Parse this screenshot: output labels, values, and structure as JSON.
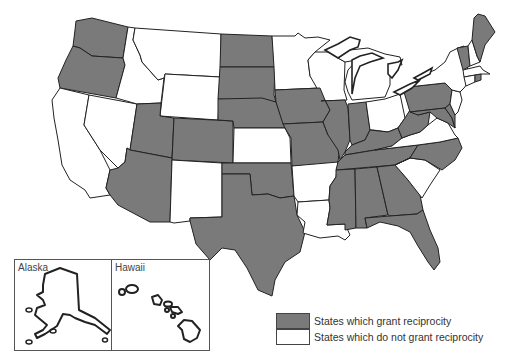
{
  "map": {
    "title": "",
    "colors": {
      "grant": "#7a7a7a",
      "no_grant": "#ffffff",
      "border": "#222222"
    },
    "states_grant": [
      "Washington",
      "Oregon",
      "Utah",
      "Arizona",
      "Colorado",
      "North Dakota",
      "South Dakota",
      "Nebraska",
      "Oklahoma",
      "Texas",
      "Iowa",
      "Missouri",
      "Illinois",
      "Indiana",
      "Kentucky",
      "Tennessee",
      "Mississippi",
      "Alabama",
      "Georgia",
      "Florida",
      "North Carolina",
      "West Virginia",
      "Pennsylvania",
      "Maryland",
      "Delaware",
      "Vermont",
      "Maine",
      "Rhode Island"
    ],
    "states_no_grant": [
      "California",
      "Nevada",
      "Idaho",
      "Montana",
      "Wyoming",
      "New Mexico",
      "Kansas",
      "Minnesota",
      "Wisconsin",
      "Michigan",
      "Arkansas",
      "Louisiana",
      "Ohio",
      "Virginia",
      "South Carolina",
      "New York",
      "New Jersey",
      "New Hampshire",
      "Massachusetts",
      "Connecticut",
      "Alaska",
      "Hawaii"
    ]
  },
  "insets": {
    "alaska": {
      "label": "Alaska"
    },
    "hawaii": {
      "label": "Hawaii"
    }
  },
  "legend": {
    "items": [
      {
        "label": "States which grant reciprocity",
        "color": "#7a7a7a"
      },
      {
        "label": "States which do not grant reciprocity",
        "color": "#ffffff"
      }
    ]
  }
}
